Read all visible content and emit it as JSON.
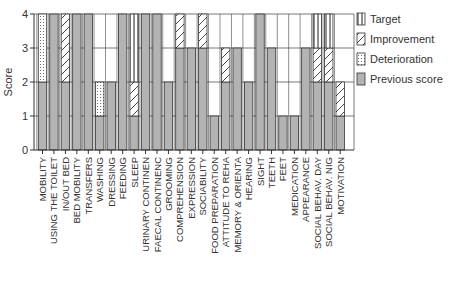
{
  "chart_data": {
    "type": "bar",
    "stacked": true,
    "title": "",
    "xlabel": "",
    "ylabel": "Score",
    "ylim": [
      0,
      4
    ],
    "yticks": [
      0,
      1,
      2,
      3,
      4
    ],
    "grid": "horizontal lines at each integer score",
    "legend_position": "right",
    "legend": [
      {
        "key": "target",
        "label": "Target",
        "pattern": "vertical-stripes"
      },
      {
        "key": "improvement",
        "label": "Improvement",
        "pattern": "diagonal-hatch"
      },
      {
        "key": "deterioration",
        "label": "Deterioration",
        "pattern": "dots"
      },
      {
        "key": "previous",
        "label": "Previous score",
        "pattern": "solid-gray"
      }
    ],
    "categories": [
      "MOBILITY",
      "USING THE TOILET",
      "IN/OUT BED",
      "BED MOBILITY",
      "TRANSFERS",
      "WASHING",
      "DRESSING",
      "FEEDING",
      "SLEEP",
      "URINARY CONTINEN",
      "FAECAL CONTINENC",
      "GROOMING",
      "COMPREHENSION",
      "EXPRESSION",
      "SOCIABILITY",
      "FOOD PREPARATION",
      "ATTITUDE TO REHA",
      "MEMORY & ORIENTA",
      "HEARING",
      "SIGHT",
      "TEETH",
      "FEET",
      "MEDICATION",
      "APPEARANCE",
      "SOCIAL BEHAV. DAY",
      "SOCIAL BEHAV. NIG",
      "MOTIVATION"
    ],
    "series": [
      {
        "name": "Previous score",
        "key": "previous",
        "values": [
          2,
          4,
          2,
          4,
          4,
          1,
          2,
          4,
          1,
          4,
          4,
          2,
          3,
          3,
          3,
          1,
          2,
          3,
          2,
          4,
          3,
          1,
          1,
          3,
          2,
          2,
          1
        ]
      },
      {
        "name": "Deterioration",
        "key": "deterioration",
        "values": [
          2,
          0,
          0,
          0,
          0,
          1,
          0,
          0,
          0,
          0,
          0,
          0,
          0,
          0,
          0,
          0,
          0,
          0,
          0,
          0,
          0,
          0,
          0,
          0,
          0,
          0,
          0
        ]
      },
      {
        "name": "Improvement",
        "key": "improvement",
        "values": [
          0,
          0,
          2,
          0,
          0,
          0,
          0,
          0,
          1,
          0,
          0,
          0,
          1,
          0,
          1,
          0,
          1,
          0,
          0,
          0,
          0,
          0,
          0,
          0,
          1,
          1,
          1
        ]
      },
      {
        "name": "Target",
        "key": "target",
        "values": [
          0,
          0,
          0,
          0,
          0,
          0,
          0,
          0,
          2,
          0,
          0,
          0,
          0,
          0,
          0,
          0,
          0,
          0,
          0,
          0,
          0,
          0,
          0,
          0,
          1,
          1,
          0
        ]
      }
    ]
  },
  "colors": {
    "previous": "#b3b3b3",
    "axis": "#333333",
    "grid": "#555555",
    "bar_outline": "#333333"
  }
}
